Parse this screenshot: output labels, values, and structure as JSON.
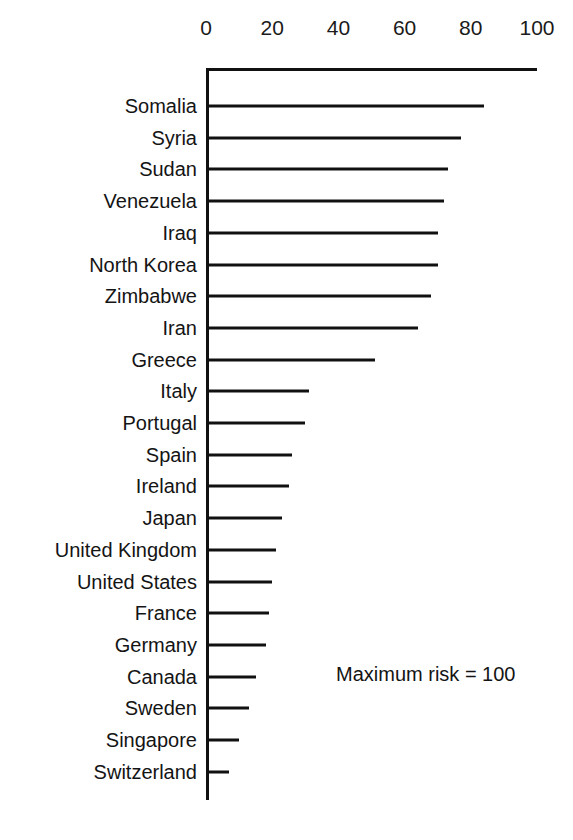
{
  "chart_data": {
    "type": "bar",
    "orientation": "horizontal",
    "title": "",
    "subtitle": "",
    "xlabel": "",
    "ylabel": "",
    "xlim": [
      0,
      100
    ],
    "ylim": null,
    "grid": false,
    "legend": null,
    "axis_ticks": [
      0,
      20,
      40,
      60,
      80,
      100
    ],
    "tick_labels": [
      "0",
      "20",
      "40",
      "60",
      "80",
      "100"
    ],
    "annotations": [
      "Maximum risk = 100"
    ],
    "categories": [
      "Somalia",
      "Syria",
      "Sudan",
      "Venezuela",
      "Iraq",
      "North Korea",
      "Zimbabwe",
      "Iran",
      "Greece",
      "Italy",
      "Portugal",
      "Spain",
      "Ireland",
      "Japan",
      "United Kingdom",
      "United States",
      "France",
      "Germany",
      "Canada",
      "Sweden",
      "Singapore",
      "Switzerland"
    ],
    "values": [
      84,
      77,
      73,
      72,
      70,
      70,
      68,
      64,
      51,
      31,
      30,
      26,
      25,
      23,
      21,
      20,
      19,
      18,
      15,
      13,
      10,
      7
    ],
    "bar_color": "#111111",
    "axis_color": "#111111",
    "background_color": "#ffffff"
  },
  "layout": {
    "plot_left_px": 206,
    "plot_right_px": 537,
    "axis_top_y_px": 68,
    "axis_bottom_y_px": 800,
    "first_row_y_px": 106,
    "row_spacing_px": 31.7,
    "annotation_x_px": 336,
    "annotation_y_px": 663
  }
}
